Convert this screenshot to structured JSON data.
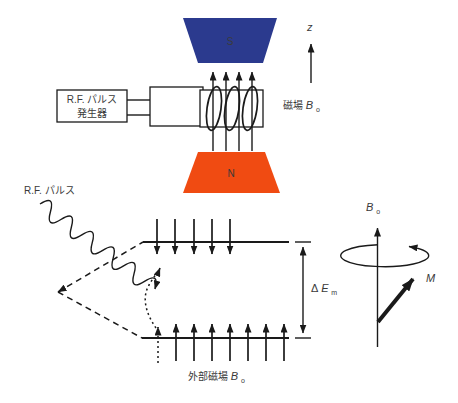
{
  "colors": {
    "magnet_s_fill": "#2b3a8e",
    "magnet_s_text": "#9fa9d6",
    "magnet_n_fill": "#f04b12",
    "magnet_n_text": "#fbe9da",
    "line": "#1a1a1a",
    "text": "#3a3a3a",
    "background": "#ffffff"
  },
  "top_diagram": {
    "magnet_s_label": "S",
    "magnet_n_label": "N",
    "generator_label_line1": "R.F. パルス",
    "generator_label_line2": "発生器",
    "field_label_text": "磁場 ",
    "field_label_var": "B",
    "field_label_sub": "o",
    "z_axis_label": "z",
    "field_arrow_count": 4,
    "coil_turns": 3
  },
  "bottom_diagram": {
    "rf_pulse_label": "R.F. パルス",
    "delta_e_delta": "Δ",
    "delta_e_var": "E",
    "delta_e_sub": "m",
    "external_field_text": "外部磁場 ",
    "external_field_var": "B",
    "external_field_sub": "o",
    "upper_level_down_arrow_count": 5,
    "lower_level_up_arrow_count": 7
  },
  "precession_diagram": {
    "axis_var": "B",
    "axis_sub": "o",
    "magnetization_label": "M"
  }
}
